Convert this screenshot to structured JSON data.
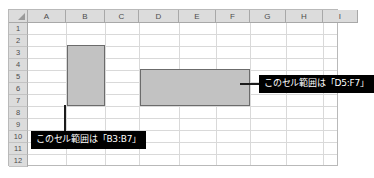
{
  "sheet": {
    "columns": [
      "A",
      "B",
      "C",
      "D",
      "E",
      "F",
      "G",
      "H",
      "I"
    ],
    "rows": [
      "1",
      "2",
      "3",
      "4",
      "5",
      "6",
      "7",
      "8",
      "9",
      "10",
      "11",
      "12"
    ],
    "corner_icon": "select-all-triangle-icon",
    "header_background": "#dcdcdc",
    "gridline_color": "#d9d9d9",
    "cell_background": "#ffffff"
  },
  "selections": [
    {
      "id": "selection-b3-b7",
      "range": "B3:B7",
      "start_column": "B",
      "end_column": "B",
      "start_row": "3",
      "end_row": "7",
      "fill_color": "#c2c2c2",
      "border_color": "#6b6b6b"
    },
    {
      "id": "selection-d5-f7",
      "range": "D5:F7",
      "start_column": "D",
      "end_column": "F",
      "start_row": "5",
      "end_row": "7",
      "fill_color": "#c2c2c2",
      "border_color": "#6b6b6b"
    }
  ],
  "callouts": [
    {
      "id": "callout-b3-b7",
      "text": "このセル範囲は「B3:B7」",
      "background": "#000000",
      "text_color": "#ffffff",
      "points_to": "B3:B7"
    },
    {
      "id": "callout-d5-f7",
      "text": "このセル範囲は「D5:F7」",
      "background": "#000000",
      "text_color": "#ffffff",
      "points_to": "D5:F7"
    }
  ]
}
